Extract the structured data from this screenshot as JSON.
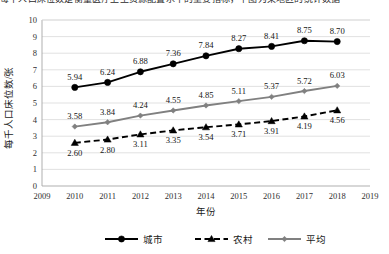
{
  "top_clipped_text": "每千人口床位数是衡量医疗卫生资源配置水平的重要指标，下图为某地区的统计数据",
  "chart_data": {
    "type": "line",
    "title": "",
    "xlabel": "年份",
    "ylabel": "每千人口床位数/张",
    "x": [
      2010,
      2011,
      2012,
      2013,
      2014,
      2015,
      2016,
      2017,
      2018
    ],
    "categories": [
      "2010",
      "2011",
      "2012",
      "2013",
      "2014",
      "2015",
      "2016",
      "2017",
      "2018"
    ],
    "xlim": [
      2009,
      2019
    ],
    "xticks": [
      "2009",
      "2010",
      "2011",
      "2012",
      "2013",
      "2014",
      "2015",
      "2016",
      "2017",
      "2018",
      "2019"
    ],
    "ylim": [
      0,
      10
    ],
    "yticks": [
      "0",
      "1",
      "2",
      "3",
      "4",
      "5",
      "6",
      "7",
      "8",
      "9",
      "10"
    ],
    "grid": "horizontal",
    "legend_position": "bottom",
    "series": [
      {
        "name": "城市",
        "color": "#000000",
        "marker": "circle",
        "linestyle": "solid",
        "label_position": "above",
        "values": [
          5.94,
          6.24,
          6.88,
          7.36,
          7.84,
          8.27,
          8.41,
          8.75,
          8.7
        ],
        "labels": [
          "5.94",
          "6.24",
          "6.88",
          "7.36",
          "7.84",
          "8.27",
          "8.41",
          "8.75",
          "8.70"
        ]
      },
      {
        "name": "农村",
        "color": "#000000",
        "marker": "triangle",
        "linestyle": "dashed",
        "label_position": "below",
        "values": [
          2.6,
          2.8,
          3.11,
          3.35,
          3.54,
          3.71,
          3.91,
          4.19,
          4.56
        ],
        "labels": [
          "2.60",
          "2.80",
          "3.11",
          "3.35",
          "3.54",
          "3.71",
          "3.91",
          "4.19",
          "4.56"
        ]
      },
      {
        "name": "平均",
        "color": "#808080",
        "marker": "diamond",
        "linestyle": "solid",
        "label_position": "above",
        "values": [
          3.58,
          3.84,
          4.24,
          4.55,
          4.85,
          5.11,
          5.37,
          5.72,
          6.03
        ],
        "labels": [
          "3.58",
          "3.84",
          "4.24",
          "4.55",
          "4.85",
          "5.11",
          "5.37",
          "5.72",
          "6.03"
        ]
      }
    ]
  },
  "legend": [
    {
      "label": "城市"
    },
    {
      "label": "农村"
    },
    {
      "label": "平均"
    }
  ]
}
